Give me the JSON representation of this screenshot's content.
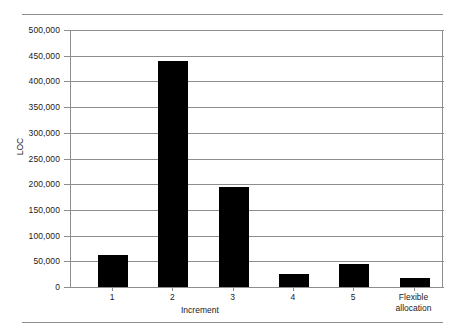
{
  "chart_data": {
    "type": "bar",
    "title": "",
    "xlabel": "Increment",
    "ylabel": "LOC",
    "categories": [
      "1",
      "2",
      "3",
      "4",
      "5",
      "Flexible allocation"
    ],
    "values": [
      63000,
      440000,
      195000,
      25000,
      45000,
      17000
    ],
    "ylim": [
      0,
      500000
    ],
    "ytick_interval": 50000,
    "ytick_labels": [
      "500,000",
      "450,000",
      "400,000",
      "350,000",
      "300,000",
      "250,000",
      "200,000",
      "150,000",
      "100,000",
      "50,000",
      "0"
    ],
    "ytick_values": [
      500000,
      450000,
      400000,
      350000,
      300000,
      250000,
      200000,
      150000,
      100000,
      50000,
      0
    ],
    "grid": true,
    "legend": null,
    "bar_color": "#000000",
    "grid_color": "#8d8d8d",
    "axis_color": "#8d8d8d",
    "background": "#ffffff",
    "series": [
      {
        "name": "LOC",
        "values": [
          63000,
          440000,
          195000,
          25000,
          45000,
          17000
        ]
      }
    ]
  },
  "category_labels": {
    "c0": "1",
    "c1": "2",
    "c2": "3",
    "c3": "4",
    "c4": "5",
    "c5_line1": "Flexible",
    "c5_line2": "allocation"
  },
  "axis": {
    "y_title": "LOC",
    "x_title": "Increment"
  }
}
